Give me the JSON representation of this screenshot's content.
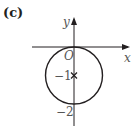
{
  "part_label": "(c)",
  "axes": {
    "x_label": "x",
    "y_label": "y",
    "origin_label": "O"
  },
  "ticks": {
    "y_minus_1": "−1",
    "y_minus_2": "−2"
  },
  "circle": {
    "center": [
      0,
      -1
    ],
    "radius": 1,
    "center_marker": "×"
  },
  "colors": {
    "stroke": "#231f20",
    "axis": "#231f20"
  }
}
